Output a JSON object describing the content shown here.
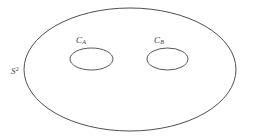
{
  "figure": {
    "kind": "math-topology-diagram",
    "background_color": "#ffffff",
    "stroke_color": "#3a3a3f",
    "text_color": "#3b3b40"
  },
  "labels": {
    "surface": {
      "base": "S",
      "superscript": "2",
      "plain": "S2"
    },
    "curve_a": {
      "base": "C",
      "subscript": "A",
      "plain": "CA"
    },
    "curve_b": {
      "base": "C",
      "subscript": "B",
      "plain": "CB"
    }
  },
  "shapes": {
    "outer_ellipse": {
      "name": "sphere-boundary",
      "cx": 130,
      "cy": 69.5,
      "rx": 106,
      "ry": 61.5
    },
    "inner_ellipse_left": {
      "name": "curve-a",
      "cx": 91.5,
      "cy": 59,
      "rx": 21.5,
      "ry": 11
    },
    "inner_ellipse_right": {
      "name": "curve-b",
      "cx": 167.5,
      "cy": 59,
      "rx": 20.5,
      "ry": 11
    }
  }
}
